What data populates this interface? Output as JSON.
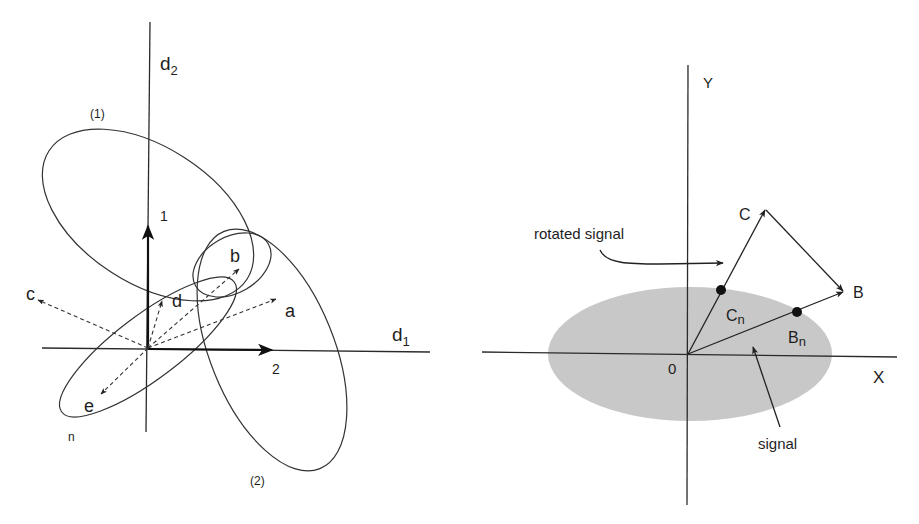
{
  "left_panel": {
    "axes": {
      "horizontal": "d",
      "horizontal_sub": "1",
      "vertical": "d",
      "vertical_sub": "2"
    },
    "basis_vectors": [
      {
        "label": "1",
        "direction": "up"
      },
      {
        "label": "2",
        "direction": "right"
      }
    ],
    "dashed_vectors": [
      {
        "label": "a"
      },
      {
        "label": "b"
      },
      {
        "label": "c"
      },
      {
        "label": "d"
      },
      {
        "label": "e"
      }
    ],
    "ellipses": [
      {
        "label": "(1)"
      },
      {
        "label": "(2)"
      },
      {
        "label": "n"
      }
    ]
  },
  "right_panel": {
    "axes": {
      "x": "X",
      "y": "Y",
      "origin": "0"
    },
    "points": [
      {
        "label": "C",
        "sub": ""
      },
      {
        "label": "B",
        "sub": ""
      },
      {
        "label": "C",
        "sub": "n"
      },
      {
        "label": "B",
        "sub": "n"
      }
    ],
    "annotations": {
      "rotated_signal": "rotated signal",
      "signal": "signal"
    },
    "colors": {
      "signal_fill": "#c8c8c8",
      "ink": "#222222"
    }
  }
}
